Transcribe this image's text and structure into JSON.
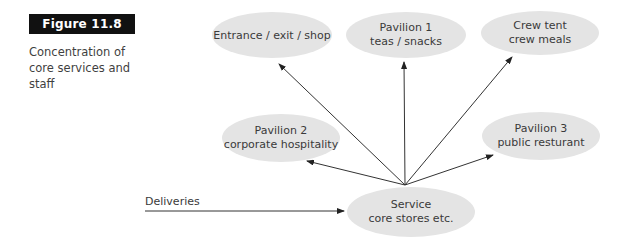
{
  "figure": {
    "label": "Figure 11.8",
    "caption_lines": [
      "Concentration of",
      "core services and",
      "staff"
    ]
  },
  "colors": {
    "label_bg": "#111111",
    "label_text": "#ffffff",
    "node_fill": "#e4e4e4",
    "arrow": "#333333",
    "text": "#3a3a3a"
  },
  "diagram": {
    "hub": {
      "id": "service",
      "lines": [
        "Service",
        "core stores etc."
      ]
    },
    "nodes": [
      {
        "id": "entrance",
        "lines": [
          "Entrance / exit / shop"
        ]
      },
      {
        "id": "pavilion1",
        "lines": [
          "Pavilion 1",
          "teas / snacks"
        ]
      },
      {
        "id": "crew-tent",
        "lines": [
          "Crew tent",
          "crew meals"
        ]
      },
      {
        "id": "pavilion2",
        "lines": [
          "Pavilion 2",
          "corporate hospitality"
        ]
      },
      {
        "id": "pavilion3",
        "lines": [
          "Pavilion 3",
          "public resturant"
        ]
      }
    ],
    "input": {
      "label": "Deliveries",
      "target": "service"
    },
    "edges": [
      {
        "from": "service",
        "to": "entrance"
      },
      {
        "from": "service",
        "to": "pavilion1"
      },
      {
        "from": "service",
        "to": "crew-tent"
      },
      {
        "from": "service",
        "to": "pavilion2"
      },
      {
        "from": "service",
        "to": "pavilion3"
      },
      {
        "from": "deliveries",
        "to": "service"
      }
    ]
  }
}
